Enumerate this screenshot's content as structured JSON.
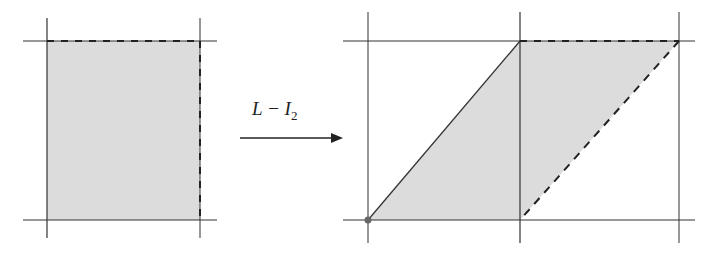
{
  "diagram": {
    "transform_label": {
      "main": "L − I",
      "subscript": "2"
    },
    "colors": {
      "fill": "#dcdcdc",
      "line": "#333333",
      "dot": "#666666"
    },
    "left_figure": {
      "grid_x": [
        47,
        200
      ],
      "grid_y": [
        41,
        220
      ],
      "square": [
        [
          47,
          41
        ],
        [
          200,
          41
        ],
        [
          200,
          220
        ],
        [
          47,
          220
        ]
      ],
      "dashed_edges": [
        "top",
        "right"
      ]
    },
    "right_figure": {
      "grid_x": [
        368,
        520,
        679
      ],
      "grid_y": [
        41,
        220
      ],
      "parallelogram": [
        [
          368,
          220
        ],
        [
          520,
          41
        ],
        [
          679,
          41
        ],
        [
          520,
          220
        ]
      ],
      "dashed_edges": [
        "top",
        "right-diagonal"
      ],
      "origin_dot": [
        368,
        220
      ]
    },
    "arrow": {
      "from": [
        240,
        138
      ],
      "to": [
        343,
        138
      ]
    }
  }
}
